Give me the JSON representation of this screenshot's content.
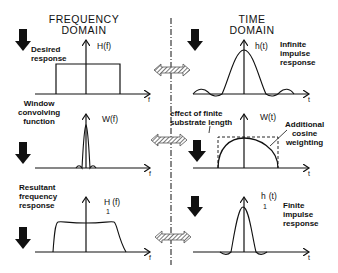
{
  "headers": {
    "frequency": "FREQUENCY\nDOMAIN",
    "time": "TIME\nDOMAIN"
  },
  "rows": [
    {
      "freq_label": "Desired\nresponse",
      "freq_function": "H(f)",
      "freq_axis": "f",
      "time_function": "h(t)",
      "time_label": "Infinite\nimpulse\nresponse",
      "time_axis": "t"
    },
    {
      "freq_label": "Window\nconvolving\nfunction",
      "freq_function": "W(f)",
      "freq_axis": "f",
      "time_function": "W(t)",
      "time_annotation_left": "effect of finite\nsubstrate length",
      "time_annotation_right": "Additional\ncosine\nweighting",
      "time_axis": "t"
    },
    {
      "freq_label": "Resultant\nfrequency\nresponse",
      "freq_function": "H",
      "freq_function_sub": "1",
      "freq_function_arg": "(f)",
      "freq_axis": "f",
      "time_function": "h",
      "time_function_sub": "1",
      "time_function_arg": "(t)",
      "time_label": "Finite\nimpulse\nresponse",
      "time_axis": "t"
    }
  ],
  "icons": [
    "down-arrow-icon",
    "double-arrow-icon"
  ],
  "colors": {
    "ink": "#111111",
    "hatch": "#7a7a7a",
    "background": "#ffffff"
  }
}
